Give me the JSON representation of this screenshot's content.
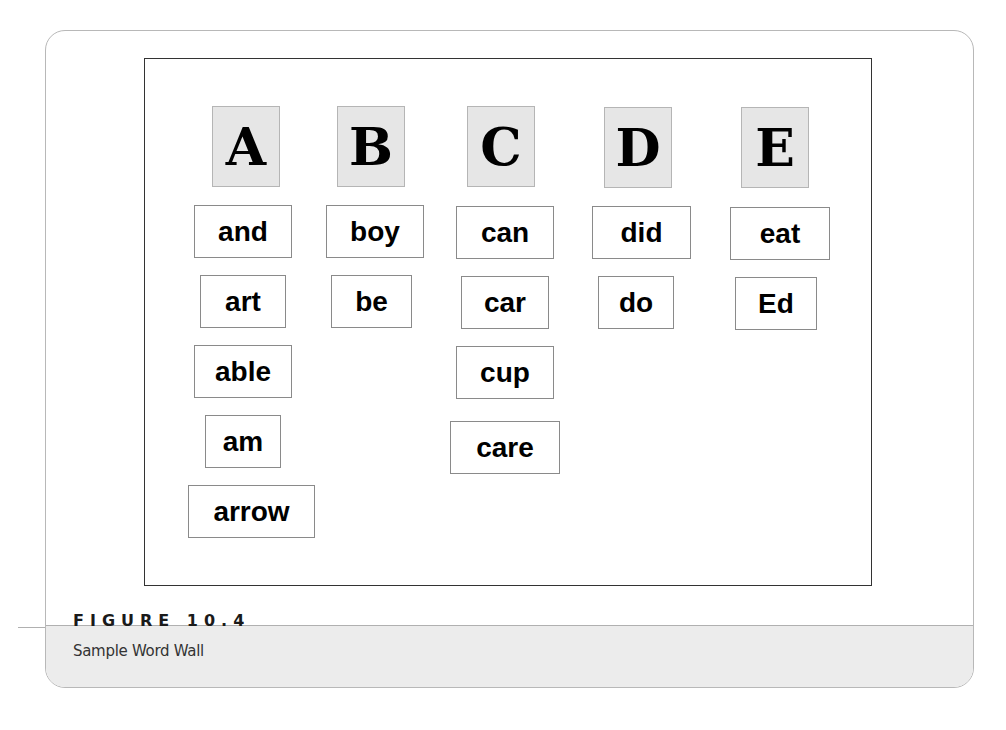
{
  "figure": {
    "label": "FIGURE 10.4",
    "caption": "Sample Word Wall"
  },
  "word_wall": {
    "columns": [
      {
        "letter": "A",
        "words": [
          "and",
          "art",
          "able",
          "am",
          "arrow"
        ]
      },
      {
        "letter": "B",
        "words": [
          "boy",
          "be"
        ]
      },
      {
        "letter": "C",
        "words": [
          "can",
          "car",
          "cup",
          "care"
        ]
      },
      {
        "letter": "D",
        "words": [
          "did",
          "do"
        ]
      },
      {
        "letter": "E",
        "words": [
          "eat",
          "Ed"
        ]
      }
    ]
  },
  "colors": {
    "letter_tile_bg": "#e6e6e6",
    "caption_band_bg": "#ececec",
    "frame_border": "#333333"
  }
}
